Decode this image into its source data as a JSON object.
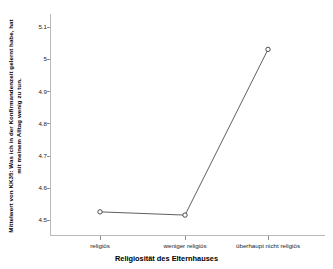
{
  "chart_data": {
    "type": "line",
    "title": "",
    "subtitle": "",
    "xlabel": "Religiosität des Elternhauses",
    "ylabel": "Mittelwert von KK35: Was ich in der Konfirmandenzeit gelernt habe, hat mit meinem Alltag wenig zu tun.",
    "categories": [
      "religiös",
      "weniger religiös",
      "überhaupt nicht religiös"
    ],
    "values": [
      4.525,
      4.515,
      5.03
    ],
    "series": [
      {
        "name": "Mittelwert KK35",
        "values": [
          4.525,
          4.515,
          5.03
        ]
      }
    ],
    "ylim": [
      4.45,
      5.14
    ],
    "yticks": [
      "4.5",
      "4.6",
      "4.7",
      "4.8",
      "4.9",
      "5",
      "5.1"
    ],
    "ytick_values": [
      4.5,
      4.6,
      4.7,
      4.8,
      4.9,
      5.0,
      5.1
    ],
    "grid": false,
    "legend": false,
    "legend_position": "none",
    "marker": "circle-open",
    "line_color": "#4d4d4d",
    "marker_color": "#3a3a3a",
    "axis_color": "#b9b9b9",
    "background_color": "#ffffff"
  },
  "axes": {
    "y_title": "Mittelwert von KK35: Was ich in der Konfirmandenzeit gelernt habe, hat mit meinem Alltag wenig zu tun.",
    "x_title": "Religiosität des Elternhauses"
  }
}
